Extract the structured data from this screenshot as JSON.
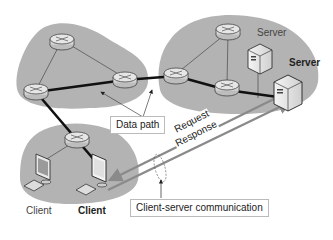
{
  "labels": {
    "server_top": "Server",
    "server_main": "Server",
    "client_left": "Client",
    "client_main": "Client",
    "data_path": "Data path",
    "request": "Request",
    "response": "Response",
    "client_server_comm": "Client-server communication"
  },
  "colors": {
    "cloud": "#b3b3b3",
    "link_thin": "#555555",
    "link_thick": "#111111",
    "arrow": "#8a8a8a"
  },
  "networks": [
    {
      "name": "left-network",
      "routers": 3
    },
    {
      "name": "right-network",
      "routers": 3,
      "servers": 2
    },
    {
      "name": "client-network",
      "routers": 1,
      "clients": 2
    }
  ]
}
